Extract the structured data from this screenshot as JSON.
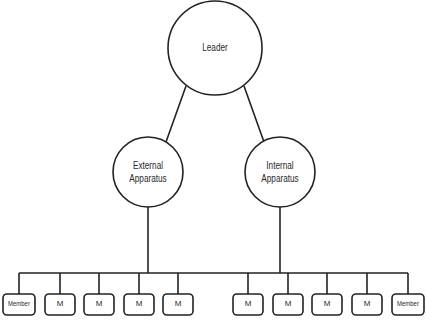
{
  "diagram": {
    "type": "org-chart",
    "leader": {
      "label": "Leader"
    },
    "apparatus": [
      {
        "label_line1": "External",
        "label_line2": "Apparatus"
      },
      {
        "label_line1": "Internal",
        "label_line2": "Apparatus"
      }
    ],
    "members": [
      {
        "label": "Member"
      },
      {
        "label": "M"
      },
      {
        "label": "M"
      },
      {
        "label": "M"
      },
      {
        "label": "M"
      },
      {
        "label": "M"
      },
      {
        "label": "M"
      },
      {
        "label": "M"
      },
      {
        "label": "M"
      },
      {
        "label": "Member"
      }
    ],
    "colors": {
      "stroke": "#222222",
      "background": "#ffffff",
      "text": "#2a2a2a"
    }
  }
}
